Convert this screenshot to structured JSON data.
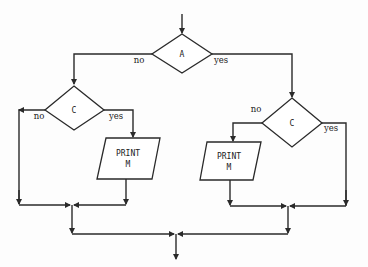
{
  "diagram": {
    "type": "flowchart",
    "nodes": {
      "decision_a": {
        "label": "A"
      },
      "decision_c_left": {
        "label": "C"
      },
      "decision_c_right": {
        "label": "C"
      },
      "print_left": {
        "line1": "PRINT",
        "line2": "M"
      },
      "print_right": {
        "line1": "PRINT",
        "line2": "M"
      }
    },
    "edges": {
      "a_no": "no",
      "a_yes": "yes",
      "c_left_no": "no",
      "c_left_yes": "yes",
      "c_right_no": "no",
      "c_right_yes": "yes"
    }
  }
}
